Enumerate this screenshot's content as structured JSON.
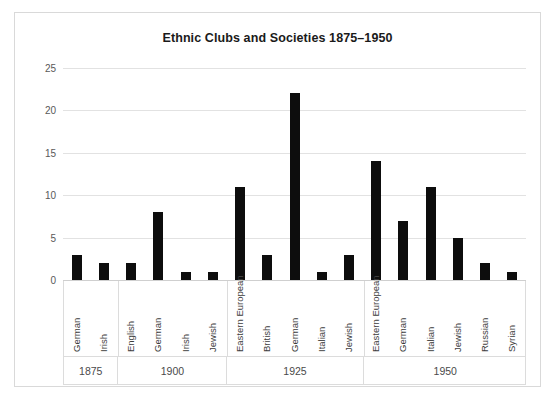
{
  "chart_data": {
    "type": "bar",
    "title": "Ethnic Clubs and Societies 1875–1950",
    "xlabel": "",
    "ylabel": "",
    "ylim": [
      0,
      25
    ],
    "yticks": [
      0,
      5,
      10,
      15,
      20,
      25
    ],
    "grid": true,
    "legend": "none",
    "bar_color": "#0d0d0d",
    "groups": [
      {
        "label": "1875",
        "categories": [
          "German",
          "Irish"
        ],
        "values": [
          3,
          2
        ]
      },
      {
        "label": "1900",
        "categories": [
          "English",
          "German",
          "Irish",
          "Jewish"
        ],
        "values": [
          2,
          8,
          1,
          1
        ]
      },
      {
        "label": "1925",
        "categories": [
          "Eastern European",
          "British",
          "German",
          "Italian",
          "Jewish"
        ],
        "values": [
          11,
          3,
          22,
          1,
          3
        ]
      },
      {
        "label": "1950",
        "categories": [
          "Eastern European",
          "German",
          "Italian",
          "Jewish",
          "Russian",
          "Syrian"
        ],
        "values": [
          14,
          7,
          11,
          5,
          2,
          1
        ]
      }
    ]
  }
}
